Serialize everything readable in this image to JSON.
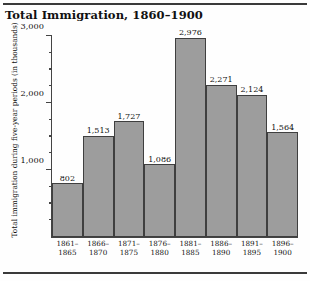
{
  "figure": {
    "title": "Total Immigration, 1860–1900"
  },
  "chart_data": {
    "type": "bar",
    "title": "Total Immigration, 1860–1900",
    "xlabel": "",
    "ylabel": "Total immigration during five-year periods (in thousands)",
    "categories": [
      "1861–1865",
      "1866–1870",
      "1871–1875",
      "1876–1880",
      "1881–1885",
      "1886–1890",
      "1891–1895",
      "1896–1900"
    ],
    "category_lines": [
      [
        "1861–",
        "1865"
      ],
      [
        "1866–",
        "1870"
      ],
      [
        "1871–",
        "1875"
      ],
      [
        "1876–",
        "1880"
      ],
      [
        "1881–",
        "1885"
      ],
      [
        "1886–",
        "1890"
      ],
      [
        "1891–",
        "1895"
      ],
      [
        "1896–",
        "1900"
      ]
    ],
    "values": [
      802,
      1513,
      1727,
      1086,
      2976,
      2271,
      2124,
      1564
    ],
    "value_labels": [
      "802",
      "1,513",
      "1,727",
      "1,086",
      "2,976",
      "2,271",
      "2,124",
      "1,564"
    ],
    "ylim": [
      0,
      3000
    ],
    "ytick_major": [
      1000,
      2000,
      3000
    ],
    "ytick_major_labels": [
      "1,000",
      "2,000",
      "3,000"
    ],
    "ytick_minor_step": 250,
    "grid": false,
    "legend": false,
    "bar_color": "#9d9d9d",
    "bar_edge_color": "#3f3f3f",
    "axis_color": "#444444",
    "text_color": "#111111",
    "background": "#fefefe"
  }
}
